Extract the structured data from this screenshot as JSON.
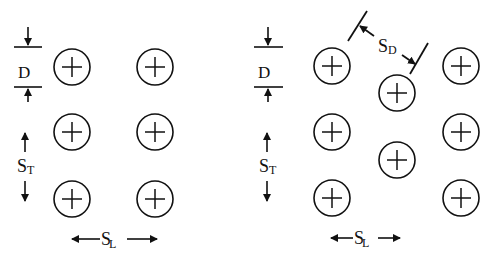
{
  "diagram": {
    "colors": {
      "stroke": "#111111",
      "background": "#ffffff"
    },
    "tube_radius": 18,
    "panels": [
      {
        "name": "aligned",
        "tubes": [
          {
            "x": 72,
            "y": 67
          },
          {
            "x": 155,
            "y": 67
          },
          {
            "x": 72,
            "y": 132
          },
          {
            "x": 155,
            "y": 132
          },
          {
            "x": 72,
            "y": 199
          },
          {
            "x": 155,
            "y": 199
          }
        ],
        "labels": {
          "D": {
            "main": "D",
            "sub": ""
          },
          "ST": {
            "main": "S",
            "sub": "T"
          },
          "SL": {
            "main": "S",
            "sub": "L"
          }
        }
      },
      {
        "name": "staggered",
        "tubes": [
          {
            "x": 332,
            "y": 66
          },
          {
            "x": 461,
            "y": 66
          },
          {
            "x": 397,
            "y": 93
          },
          {
            "x": 332,
            "y": 132
          },
          {
            "x": 461,
            "y": 132
          },
          {
            "x": 397,
            "y": 160
          },
          {
            "x": 332,
            "y": 198
          },
          {
            "x": 461,
            "y": 198
          }
        ],
        "labels": {
          "D": {
            "main": "D",
            "sub": ""
          },
          "ST": {
            "main": "S",
            "sub": "T"
          },
          "SL": {
            "main": "S",
            "sub": "L"
          },
          "SD": {
            "main": "S",
            "sub": "D"
          }
        }
      }
    ]
  }
}
